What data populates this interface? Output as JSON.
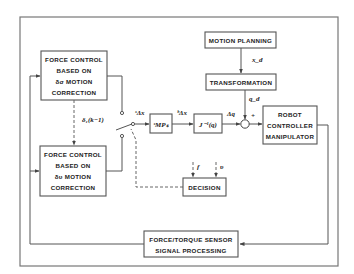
{
  "diagram": {
    "type": "block-diagram",
    "blocks": {
      "force_control_sigma": [
        "FORCE CONTROL",
        "BASED ON",
        "δσ MOTION",
        "CORRECTION"
      ],
      "force_control_upsilon": [
        "FORCE CONTROL",
        "BASED ON",
        "δυ MOTION",
        "CORRECTION"
      ],
      "motion_planning": "MOTION PLANNING",
      "transformation": "TRANSFORMATION",
      "mps": "ˢMPₛ",
      "jacobian_inverse": "J⁻¹(q)",
      "robot": [
        "ROBOT",
        "CONTROLLER",
        "MANIPULATOR"
      ],
      "decision": "DECISION",
      "sensor": [
        "FORCE/TORQUE SENSOR",
        "SIGNAL PROCESSING"
      ]
    },
    "signals": {
      "delta_prev": "δ₁(k−1)",
      "s_delta_x": "ˢΔx",
      "b_delta_x": "ᵇΔx",
      "delta_q": "Δq",
      "x_d": "x_d",
      "q_d": "q_d",
      "plus": "+",
      "f": "f",
      "v": "υ"
    },
    "colors": {
      "stroke": "#555555",
      "text": "#222222",
      "background": "#ffffff"
    }
  }
}
